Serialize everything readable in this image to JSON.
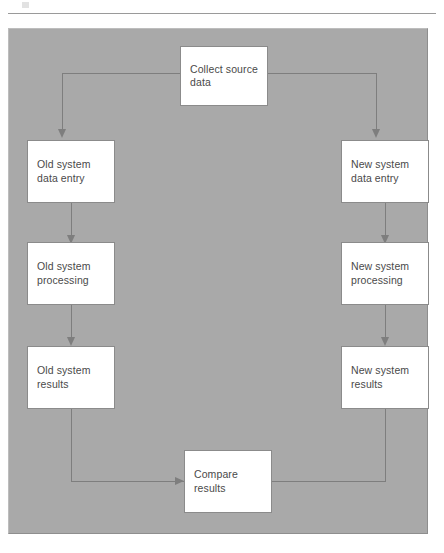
{
  "figure": {
    "type": "flowchart",
    "orientation": "top-down-parallel-branches",
    "panel_color": "#a9a9a9",
    "node_fill": "#ffffff",
    "node_border": "#8b8b8b",
    "connector_color": "#7e7e7e",
    "text_color": "#4a4a4a"
  },
  "nodes": {
    "collect_source": {
      "label": "Collect source\ndata",
      "line1": "Collect source",
      "line2": "data"
    },
    "old_data_entry": {
      "label": "Old system\ndata entry",
      "line1": "Old system",
      "line2": "data entry"
    },
    "old_processing": {
      "label": "Old system\nprocessing",
      "line1": "Old system",
      "line2": "processing"
    },
    "old_results": {
      "label": "Old system\nresults",
      "line1": "Old system",
      "line2": "results"
    },
    "new_data_entry": {
      "label": "New system\ndata entry",
      "line1": "New system",
      "line2": "data entry"
    },
    "new_processing": {
      "label": "New system\nprocessing",
      "line1": "New system",
      "line2": "processing"
    },
    "new_results": {
      "label": "New system\nresults",
      "line1": "New system",
      "line2": "results"
    },
    "compare_results": {
      "label": "Compare\nresults",
      "line1": "Compare",
      "line2": "results"
    }
  },
  "edges": [
    {
      "from": "collect_source",
      "to": "old_data_entry",
      "style": "elbow-left-down",
      "arrow": "down"
    },
    {
      "from": "collect_source",
      "to": "new_data_entry",
      "style": "elbow-right-down",
      "arrow": "down"
    },
    {
      "from": "old_data_entry",
      "to": "old_processing",
      "style": "straight-down",
      "arrow": "down"
    },
    {
      "from": "old_processing",
      "to": "old_results",
      "style": "straight-down",
      "arrow": "down"
    },
    {
      "from": "new_data_entry",
      "to": "new_processing",
      "style": "straight-down",
      "arrow": "down"
    },
    {
      "from": "new_processing",
      "to": "new_results",
      "style": "straight-down",
      "arrow": "down"
    },
    {
      "from": "old_results",
      "to": "compare_results",
      "style": "elbow-down-right",
      "arrow": "right"
    },
    {
      "from": "new_results",
      "to": "compare_results",
      "style": "elbow-down-left",
      "arrow": "left"
    }
  ]
}
